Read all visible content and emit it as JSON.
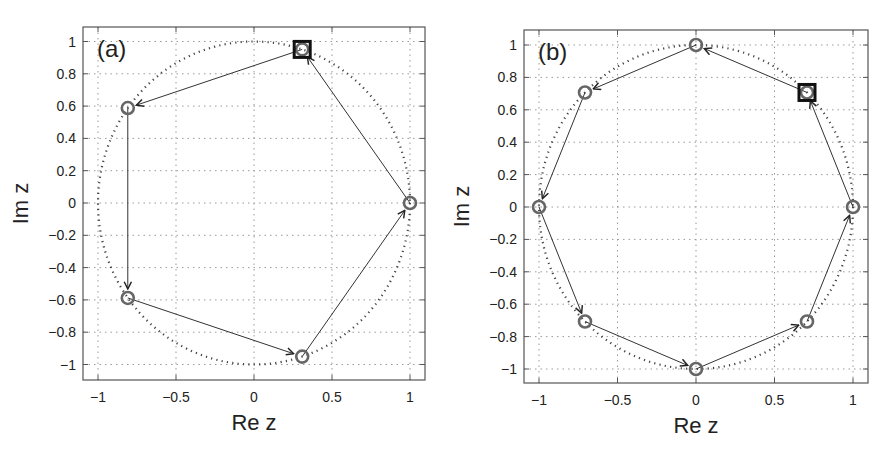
{
  "chart_data": [
    {
      "type": "scatter",
      "panel_label": "(a)",
      "xlabel": "Re z",
      "ylabel": "Im z",
      "xlim": [
        -1.1,
        1.1
      ],
      "ylim": [
        -1.1,
        1.1
      ],
      "xticks": [
        -1,
        -0.5,
        0,
        0.5,
        1
      ],
      "xtick_labels": [
        "−1",
        "−0.5",
        "0",
        "0.5",
        "1"
      ],
      "yticks": [
        1,
        0.8,
        0.6,
        0.4,
        0.2,
        0,
        -0.2,
        -0.4,
        -0.6,
        -0.8,
        -1
      ],
      "ytick_labels": [
        "1",
        "0.8",
        "0.6",
        "0.4",
        "0.2",
        "0",
        "−0.2",
        "−0.4",
        "−0.6",
        "−0.8",
        "−1"
      ],
      "grid": true,
      "unit_circle": "dotted",
      "points": [
        {
          "x": 1.0,
          "y": 0.0
        },
        {
          "x": 0.309,
          "y": 0.951
        },
        {
          "x": -0.809,
          "y": 0.588
        },
        {
          "x": -0.809,
          "y": -0.588
        },
        {
          "x": 0.309,
          "y": -0.951
        }
      ],
      "highlighted_point": {
        "x": 0.309,
        "y": 0.951,
        "marker": "square"
      },
      "arrow_sequence": [
        [
          0,
          1
        ],
        [
          1,
          2
        ],
        [
          2,
          3
        ],
        [
          3,
          4
        ],
        [
          4,
          0
        ]
      ]
    },
    {
      "type": "scatter",
      "panel_label": "(b)",
      "xlabel": "Re z",
      "ylabel": "Im z",
      "xlim": [
        -1.1,
        1.1
      ],
      "ylim": [
        -1.1,
        1.1
      ],
      "xticks": [
        -1,
        -0.5,
        0,
        0.5,
        1
      ],
      "xtick_labels": [
        "−1",
        "−0.5",
        "0",
        "0.5",
        "1"
      ],
      "yticks": [
        1,
        0.8,
        0.6,
        0.4,
        0.2,
        0,
        -0.2,
        -0.4,
        -0.6,
        -0.8,
        -1
      ],
      "ytick_labels": [
        "1",
        "0.8",
        "0.6",
        "0.4",
        "0.2",
        "0",
        "−0.2",
        "−0.4",
        "−0.6",
        "−0.8",
        "−1"
      ],
      "grid": true,
      "unit_circle": "dotted",
      "points": [
        {
          "x": 1.0,
          "y": 0.0
        },
        {
          "x": 0.707,
          "y": 0.707
        },
        {
          "x": 0.0,
          "y": 1.0
        },
        {
          "x": -0.707,
          "y": 0.707
        },
        {
          "x": -1.0,
          "y": 0.0
        },
        {
          "x": -0.707,
          "y": -0.707
        },
        {
          "x": 0.0,
          "y": -1.0
        },
        {
          "x": 0.707,
          "y": -0.707
        }
      ],
      "highlighted_point": {
        "x": 0.707,
        "y": 0.707,
        "marker": "square"
      },
      "arrow_sequence": [
        [
          0,
          1
        ],
        [
          1,
          2
        ],
        [
          2,
          3
        ],
        [
          3,
          4
        ],
        [
          4,
          5
        ],
        [
          5,
          6
        ],
        [
          6,
          7
        ],
        [
          7,
          0
        ]
      ]
    }
  ],
  "panels": [
    {
      "label": "(a)",
      "xlabel": "Re z",
      "ylabel": "Im z"
    },
    {
      "label": "(b)",
      "xlabel": "Re z",
      "ylabel": "Im z"
    }
  ],
  "colors": {
    "axes": "#555555",
    "grid": "#9a9a9a",
    "circle": "#444444",
    "marker": "#666666",
    "line": "#333333",
    "square": "#111111"
  }
}
